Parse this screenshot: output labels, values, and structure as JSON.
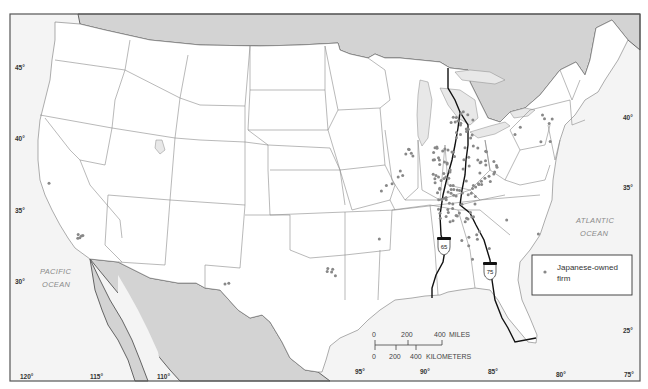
{
  "map": {
    "title": "",
    "region": "Contiguous United States",
    "latitude_labels": [
      "45°",
      "40°",
      "35°",
      "30°",
      "25°"
    ],
    "latitude_labels_right": [
      "40°",
      "35°",
      "25°"
    ],
    "longitude_labels": [
      "120°",
      "115°",
      "110°",
      "95°",
      "90°",
      "85°",
      "80°",
      "75°"
    ],
    "ocean_labels": {
      "pacific": [
        "PACIFIC",
        "OCEAN"
      ],
      "atlantic": [
        "ATLANTIC",
        "OCEAN"
      ]
    },
    "highways": [
      {
        "name": "Interstate 65",
        "label": "65"
      },
      {
        "name": "Interstate 75",
        "label": "75"
      }
    ],
    "scale_bar": {
      "miles_ticks": [
        "0",
        "200",
        "400"
      ],
      "miles_unit": "MILES",
      "km_ticks": [
        "0",
        "200",
        "400"
      ],
      "km_unit": "KILOMETERS"
    },
    "legend": {
      "symbol": "dot",
      "line1": "Japanese-owned",
      "line2": "firm"
    },
    "colors": {
      "foreign_land": "#d3d3d3",
      "firm_dot": "#888888",
      "highway": "#111111"
    }
  },
  "firms": {
    "description": "Locations of Japanese-owned firms (dot markers), concentrated along the I-65/I-75 corridor",
    "regions": [
      {
        "area": "Northern California (SF Bay)",
        "count": 1
      },
      {
        "area": "Southern California (Los Angeles)",
        "count": 5
      },
      {
        "area": "New Mexico / West Texas",
        "count": 2
      },
      {
        "area": "Texas (Dallas area)",
        "count": 5
      },
      {
        "area": "Missouri",
        "count": 3
      },
      {
        "area": "Arkansas",
        "count": 1
      },
      {
        "area": "Illinois",
        "count": 8
      },
      {
        "area": "Michigan",
        "count": 20
      },
      {
        "area": "Indiana",
        "count": 30
      },
      {
        "area": "Ohio",
        "count": 28
      },
      {
        "area": "Kentucky",
        "count": 30
      },
      {
        "area": "Tennessee",
        "count": 18
      },
      {
        "area": "Alabama / Georgia",
        "count": 8
      },
      {
        "area": "Pennsylvania / New Jersey / New England",
        "count": 8
      },
      {
        "area": "Carolinas",
        "count": 2
      }
    ]
  }
}
